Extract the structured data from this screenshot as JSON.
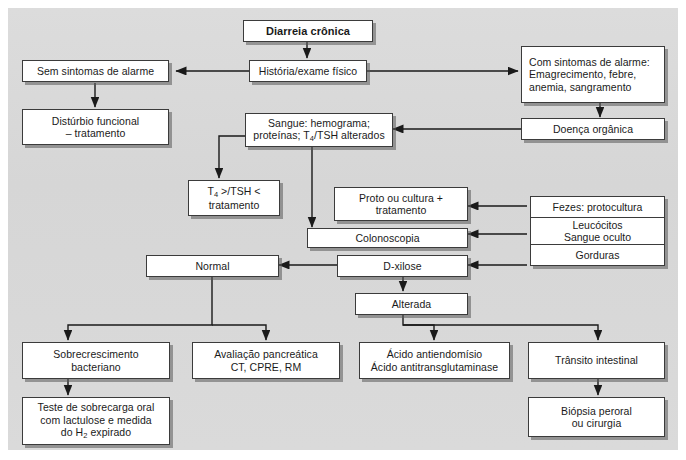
{
  "diagram": {
    "colors": {
      "panel_background": "#d9d9d9",
      "node_background": "#ffffff",
      "node_border": "#3b3b3b",
      "connector": "#1a1a1a",
      "shadow": "#5a5a5a"
    },
    "nodes": {
      "root": "Diarreia crônica",
      "historia": "História/exame físico",
      "sem_sintomas": "Sem sintomas de alarme",
      "disturbio": "Distúrbio funcional\n– tratamento",
      "com_sintomas": "Com sintomas de alarme:\nEmagrecimento, febre,\nanemia, sangramento",
      "doenca_organica": "Doença orgânica",
      "sangue_l1": "Sangue: hemograma;",
      "sangue_l2_pre": "proteínas; T",
      "sangue_l2_sub": "4",
      "sangue_l2_post": "/TSH alterados",
      "t4_l1_pre": "T",
      "t4_l1_sub": "4",
      "t4_l1_post": " >/TSH <",
      "t4_l2": "tratamento",
      "proto": "Proto ou cultura +\ntratamento",
      "colonoscopia": "Colonoscopia",
      "fezes_1": "Fezes: protocultura",
      "fezes_2": "Leucócitos\nSangue oculto",
      "fezes_3": "Gorduras",
      "normal": "Normal",
      "d_xilose": "D-xilose",
      "alterada": "Alterada",
      "sobrecrescimento": "Sobrecrescimento\nbacteriano",
      "teste_l1": "Teste de sobrecarga oral",
      "teste_l2": "com lactulose e medida",
      "teste_l3_pre": "do H",
      "teste_l3_sub": "2",
      "teste_l3_post": " expirado",
      "avaliacao": "Avaliação pancreática\nCT, CPRE, RM",
      "acido": "Ácido antiendomísio\nÁcido antitransglutaminase",
      "transito": "Trânsito intestinal",
      "biopsia": "Biópsia peroral\nou cirurgia"
    }
  }
}
